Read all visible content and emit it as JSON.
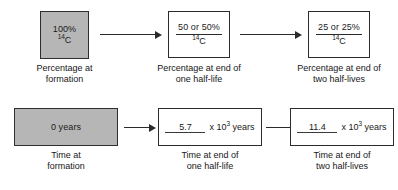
{
  "diagram": {
    "colors": {
      "filled_box": "#b6b6b6",
      "box_border": "#2b2b2b",
      "text": "#1a1a1a",
      "background": "#ffffff"
    }
  },
  "rows": [
    {
      "id": "percentage-row",
      "boxes": [
        {
          "id": "percentage-at-formation",
          "filled": true,
          "value": "100%",
          "nuclide_mass": "14",
          "nuclide_symbol": "C",
          "caption_line1": "Percentage at",
          "caption_line2": "formation"
        },
        {
          "id": "percentage-one-half-life",
          "filled": false,
          "value": "50 or 50%",
          "nuclide_mass": "14",
          "nuclide_symbol": "C",
          "caption_line1": "Percentage at end of",
          "caption_line2": "one half-life"
        },
        {
          "id": "percentage-two-half-lives",
          "filled": false,
          "value": "25 or 25%",
          "nuclide_mass": "14",
          "nuclide_symbol": "C",
          "caption_line1": "Percentage at end of",
          "caption_line2": "two half-lives"
        }
      ]
    },
    {
      "id": "time-row",
      "boxes": [
        {
          "id": "time-at-formation",
          "filled": true,
          "value": "0 years",
          "caption_line1": "Time at",
          "caption_line2": "formation"
        },
        {
          "id": "time-one-half-life",
          "filled": false,
          "answer": "5.7",
          "units_prefix": "x 10",
          "units_exponent": "3",
          "units_suffix": "years",
          "caption_line1": "Time at end of",
          "caption_line2": "one half-life"
        },
        {
          "id": "time-two-half-lives",
          "filled": false,
          "answer": "11.4",
          "units_prefix": "x 10",
          "units_exponent": "3",
          "units_suffix": "years",
          "caption_line1": "Time at end of",
          "caption_line2": "two half-lives"
        }
      ]
    }
  ]
}
